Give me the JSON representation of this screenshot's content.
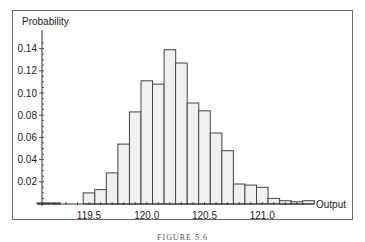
{
  "chart_data": {
    "type": "bar",
    "subtype": "histogram",
    "title": "",
    "xlabel": "Output",
    "ylabel": "Probability",
    "xlim": [
      119.05,
      121.4
    ],
    "ylim": [
      0,
      0.15
    ],
    "x_ticks": [
      "119.5",
      "120.0",
      "120.5",
      "121.0"
    ],
    "x_tick_values": [
      119.5,
      120.0,
      120.5,
      121.0
    ],
    "y_ticks": [
      "0.02",
      "0.04",
      "0.06",
      "0.08",
      "0.10",
      "0.12",
      "0.14"
    ],
    "y_tick_values": [
      0.02,
      0.04,
      0.06,
      0.08,
      0.1,
      0.12,
      0.14
    ],
    "grid": false,
    "legend": null,
    "bin_width": 0.1,
    "bin_starts": [
      119.05,
      119.15,
      119.25,
      119.35,
      119.45,
      119.55,
      119.65,
      119.75,
      119.85,
      119.95,
      120.05,
      120.15,
      120.25,
      120.35,
      120.45,
      120.55,
      120.65,
      120.75,
      120.85,
      120.95,
      121.05,
      121.15,
      121.25,
      121.35
    ],
    "values": [
      0.001,
      0.001,
      0.0,
      0.0,
      0.01,
      0.013,
      0.028,
      0.054,
      0.083,
      0.111,
      0.108,
      0.139,
      0.127,
      0.091,
      0.084,
      0.064,
      0.048,
      0.018,
      0.017,
      0.015,
      0.005,
      0.003,
      0.002,
      0.003
    ]
  },
  "caption": "FIGURE 5.6"
}
